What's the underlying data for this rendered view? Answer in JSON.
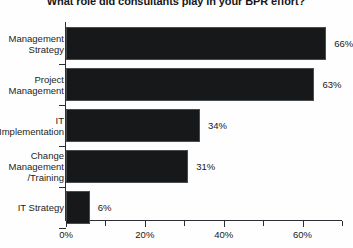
{
  "chart_data": {
    "type": "bar",
    "orientation": "horizontal",
    "title": "What role did consultants play in your BPR effort?",
    "xlabel": "",
    "ylabel": "",
    "categories": [
      "Management\nStrategy",
      "Project\nManagement",
      "IT\nImplementation",
      "Change\nManagement\n/Training",
      "IT Strategy"
    ],
    "values": [
      66,
      63,
      34,
      31,
      6
    ],
    "value_labels": [
      "66%",
      "63%",
      "34%",
      "31%",
      "6%"
    ],
    "xlim": [
      0,
      70
    ],
    "xticks": [
      0,
      20,
      40,
      60
    ],
    "xtick_labels": [
      "0%",
      "20%",
      "40%",
      "60%"
    ],
    "xticks_minor": [
      10,
      30,
      50,
      70
    ],
    "grid": false,
    "legend": null,
    "bar_color": "#16181a",
    "background_color": "#fefefe",
    "text_color": "#15181c"
  }
}
